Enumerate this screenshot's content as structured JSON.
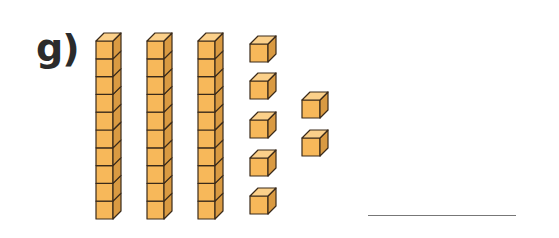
{
  "exercise": {
    "label": "g)",
    "tens_rods": 3,
    "cubes_per_rod": 10,
    "single_cubes": 7,
    "answer": ""
  },
  "colors": {
    "front": "#f7b85a",
    "top": "#fbd08a",
    "side": "#d99a42",
    "outline": "#3a2a1a",
    "answer_line": "#777777"
  },
  "layout": {
    "rods_x": [
      96,
      147,
      198
    ],
    "rod_top_y": 41,
    "cube_size": 17.8,
    "depth": 8,
    "singles": [
      {
        "x": 250,
        "y": 44
      },
      {
        "x": 250,
        "y": 81
      },
      {
        "x": 250,
        "y": 120
      },
      {
        "x": 250,
        "y": 158
      },
      {
        "x": 250,
        "y": 196
      },
      {
        "x": 302,
        "y": 100
      },
      {
        "x": 302,
        "y": 138
      }
    ]
  }
}
